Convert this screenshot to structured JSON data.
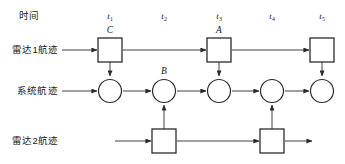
{
  "diagram": {
    "stroke_color": "#2b2b2b",
    "node_fill": "#ffffff",
    "background": "#ffffff",
    "header": {
      "time_axis_label": "时间"
    },
    "time_ticks": [
      {
        "id": "t1",
        "base": "t",
        "sub": "1",
        "x": 110
      },
      {
        "id": "t2",
        "base": "t",
        "sub": "2",
        "x": 164
      },
      {
        "id": "t3",
        "base": "t",
        "sub": "3",
        "x": 219
      },
      {
        "id": "t4",
        "base": "t",
        "sub": "4",
        "x": 272
      },
      {
        "id": "t5",
        "base": "t",
        "sub": "5",
        "x": 322
      }
    ],
    "rows": [
      {
        "id": "radar1",
        "label": "雷达1航迹",
        "y": 50,
        "node_shape": "square",
        "columns": [
          "t1",
          "t3",
          "t5"
        ]
      },
      {
        "id": "system",
        "label": "系统航迹",
        "y": 91,
        "node_shape": "circle",
        "columns": [
          "t1",
          "t2",
          "t3",
          "t4",
          "t5"
        ]
      },
      {
        "id": "radar2",
        "label": "雷达2航迹",
        "y": 141,
        "node_shape": "square",
        "columns": [
          "t2",
          "t4"
        ]
      }
    ],
    "node_labels": [
      {
        "id": "label-C",
        "text": "C",
        "x": 110,
        "y": 31
      },
      {
        "id": "label-A",
        "text": "A",
        "x": 219,
        "y": 31
      },
      {
        "id": "label-B",
        "text": "B",
        "x": 164,
        "y": 72
      }
    ],
    "vertical_links": [
      {
        "id": "link-t1-down",
        "x": 110,
        "from": "radar1",
        "to": "system",
        "direction": "down"
      },
      {
        "id": "link-t2-up",
        "x": 164,
        "from": "radar2",
        "to": "system",
        "direction": "up"
      },
      {
        "id": "link-t3-down",
        "x": 219,
        "from": "radar1",
        "to": "system",
        "direction": "down"
      },
      {
        "id": "link-t4-up",
        "x": 272,
        "from": "radar2",
        "to": "system",
        "direction": "up"
      },
      {
        "id": "link-t5-down",
        "x": 322,
        "from": "radar1",
        "to": "system",
        "direction": "down"
      }
    ]
  }
}
